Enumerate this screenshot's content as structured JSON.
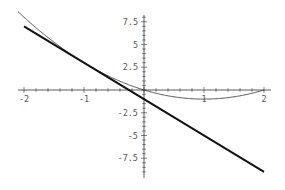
{
  "chart_data": {
    "type": "line",
    "title": "",
    "xlabel": "",
    "ylabel": "",
    "xlim": [
      -2,
      2
    ],
    "ylim": [
      -9,
      8.2
    ],
    "grid": false,
    "legend": null,
    "x_ticks": [
      "-2",
      "-1",
      "1",
      "2"
    ],
    "y_ticks": [
      "7.5",
      "5",
      "2.5",
      "-2.5",
      "-5",
      "-7.5"
    ],
    "series": [
      {
        "name": "f(x) = x^2 - 2x",
        "style": "thin",
        "x": [
          -2,
          -1.5,
          -1,
          -0.5,
          0,
          0.5,
          1,
          1.5,
          2
        ],
        "y": [
          8,
          5.25,
          3,
          1.25,
          0,
          -0.75,
          -1,
          -0.75,
          0
        ]
      },
      {
        "name": "tangent at x=-1: y = -4x - 1",
        "style": "thick",
        "x": [
          -2,
          2
        ],
        "y": [
          7,
          -9
        ]
      }
    ]
  }
}
